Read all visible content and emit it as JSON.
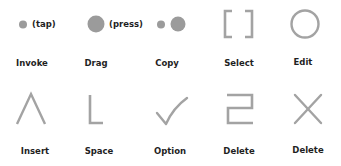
{
  "colors": {
    "glyph": "#a3a3a3",
    "dot": "#9b9b9b",
    "text": "#1f1f1f",
    "background": "#ffffff"
  },
  "gestures": [
    {
      "id": "invoke",
      "label": "Invoke",
      "glyph": "small-dot",
      "note": "(tap)"
    },
    {
      "id": "drag",
      "label": "Drag",
      "glyph": "large-dot",
      "note": "(press)"
    },
    {
      "id": "copy",
      "label": "Copy",
      "glyph": "small-dot-and-large-dot"
    },
    {
      "id": "select",
      "label": "Select",
      "glyph": "square-brackets"
    },
    {
      "id": "edit",
      "label": "Edit",
      "glyph": "circle"
    },
    {
      "id": "insert",
      "label": "Insert",
      "glyph": "caret"
    },
    {
      "id": "space",
      "label": "Space",
      "glyph": "l-stroke"
    },
    {
      "id": "option",
      "label": "Option",
      "glyph": "checkmark"
    },
    {
      "id": "delete-scratch",
      "label": "Delete",
      "glyph": "z-scratch"
    },
    {
      "id": "delete-cross",
      "label": "Delete",
      "glyph": "x-cross"
    }
  ]
}
